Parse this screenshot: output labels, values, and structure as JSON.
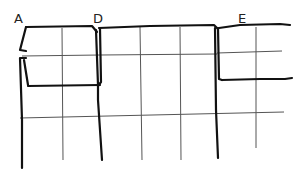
{
  "diagram": {
    "title": "",
    "labels": [
      {
        "id": "A",
        "text": "A",
        "x": 14,
        "y": 12
      },
      {
        "id": "D",
        "text": "D",
        "x": 93,
        "y": 12
      },
      {
        "id": "E",
        "text": "E",
        "x": 238,
        "y": 12
      }
    ],
    "colors": {
      "background": "#ffffff",
      "thick_stroke": "#111111",
      "thin_stroke": "#555555",
      "label": "#222222"
    },
    "grid": {
      "thin_vertical_x": [
        62,
        140,
        180,
        256
      ],
      "thin_horizontal": [
        {
          "x1": 22,
          "y1": 55,
          "x2": 100,
          "y2": 55
        },
        {
          "x1": 100,
          "y1": 55,
          "x2": 217,
          "y2": 54
        },
        {
          "x1": 217,
          "y1": 52,
          "x2": 282,
          "y2": 51
        },
        {
          "x1": 20,
          "y1": 118,
          "x2": 284,
          "y2": 112
        }
      ]
    },
    "shapes": {
      "top_edge": "A-D-E top boundary",
      "thick_verticals": [
        "A",
        "D",
        "E"
      ],
      "notch": "fold notch below A"
    }
  }
}
